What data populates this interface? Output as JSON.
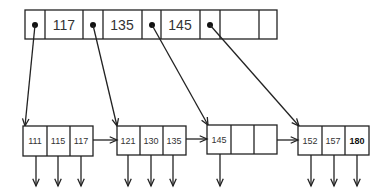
{
  "diagram": {
    "root_node": {
      "x": 25,
      "y": 10,
      "width": 252,
      "height": 29,
      "dividers": [
        45,
        83,
        103,
        142,
        161,
        200,
        220,
        259
      ],
      "keys": [
        {
          "label": "117",
          "cx": 64
        },
        {
          "label": "135",
          "cx": 122
        },
        {
          "label": "145",
          "cx": 180
        }
      ],
      "pointers": [
        {
          "cx": 35,
          "cy": 25,
          "target_x": 25,
          "target_y": 126
        },
        {
          "cx": 93,
          "cy": 25,
          "target_x": 117,
          "target_y": 126
        },
        {
          "cx": 152,
          "cy": 25,
          "target_x": 208,
          "target_y": 125
        },
        {
          "cx": 210,
          "cy": 25,
          "target_x": 299,
          "target_y": 126
        }
      ]
    },
    "leaf_nodes": [
      {
        "x": 23,
        "y": 126,
        "width": 70,
        "height": 30,
        "dividers": [
          47,
          70
        ],
        "keys": [
          {
            "label": "111",
            "cx": 35
          },
          {
            "label": "115",
            "cx": 58
          },
          {
            "label": "117",
            "cx": 81
          }
        ],
        "down_arrows": [
          36,
          58,
          81
        ]
      },
      {
        "x": 117,
        "y": 126,
        "width": 69,
        "height": 29,
        "dividers": [
          140,
          163
        ],
        "keys": [
          {
            "label": "121",
            "cx": 128
          },
          {
            "label": "130",
            "cx": 151
          },
          {
            "label": "135",
            "cx": 174
          }
        ],
        "down_arrows": [
          128,
          151,
          173
        ]
      },
      {
        "x": 207,
        "y": 125,
        "width": 70,
        "height": 29,
        "dividers": [
          231,
          254
        ],
        "keys": [
          {
            "label": "145",
            "cx": 219
          }
        ],
        "down_arrows": [
          220
        ]
      },
      {
        "x": 298,
        "y": 126,
        "width": 71,
        "height": 29,
        "dividers": [
          322,
          345
        ],
        "keys": [
          {
            "label": "152",
            "cx": 310
          },
          {
            "label": "157",
            "cx": 333
          },
          {
            "label": "180",
            "cx": 357,
            "bold": true
          }
        ],
        "down_arrows": [
          311,
          334,
          357
        ]
      }
    ],
    "sibling_links": [
      {
        "x1": 93,
        "x2": 117,
        "y": 140
      },
      {
        "x1": 186,
        "x2": 207,
        "y": 139
      },
      {
        "x1": 277,
        "x2": 298,
        "y": 140
      }
    ],
    "down_arrow_tip_y": 186
  }
}
